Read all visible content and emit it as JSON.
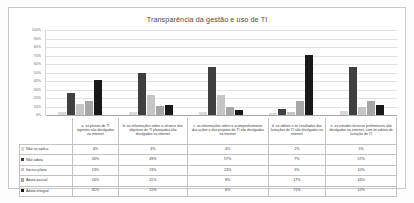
{
  "chart_data": {
    "type": "bar",
    "title": "Transparência da gestão e uso de TI",
    "xlabel": "",
    "ylabel": "",
    "ylim": [
      0,
      100
    ],
    "grid": true,
    "legend_position": "data-table-left",
    "ytick_labels": [
      "100%",
      "90%",
      "80%",
      "70%",
      "60%",
      "50%",
      "40%",
      "30%",
      "20%",
      "10%",
      "0%"
    ],
    "ytick_values": [
      100,
      90,
      80,
      70,
      60,
      50,
      40,
      30,
      20,
      10,
      0
    ],
    "categories": [
      "a. os planos de TI vigentes são divulgados na internet",
      "b. as informações sobre o alcance dos objetivos de TI planejados são divulgados na internet",
      "c. as informações sobre o acompanhamento das ações e dos projetos de TI são divulgadas na internet",
      "d. os editais e os resultados das licitações de TI são divulgados na internet",
      "e. os estudos técnicos preliminares são divulgados na internet, com os editais de licitação de TI"
    ],
    "series": [
      {
        "name": "Não se aplica",
        "color": "#d9d9d9",
        "values": [
          4,
          4,
          4,
          2,
          5
        ],
        "labels": [
          "4%",
          "4%",
          "4%",
          "2%",
          "5%"
        ]
      },
      {
        "name": "Não adota",
        "color": "#3f3f3f",
        "values": [
          26,
          49,
          57,
          7,
          57
        ],
        "labels": [
          "26%",
          "49%",
          "57%",
          "7%",
          "57%"
        ]
      },
      {
        "name": "Iniciou plano",
        "color": "#c6c6c6",
        "values": [
          13,
          23,
          23,
          3,
          10
        ],
        "labels": [
          "13%",
          "23%",
          "23%",
          "3%",
          "10%"
        ]
      },
      {
        "name": "Adota parcial",
        "color": "#a6a6a6",
        "values": [
          16,
          11,
          9,
          17,
          16
        ],
        "labels": [
          "16%",
          "11%",
          "9%",
          "17%",
          "16%"
        ]
      },
      {
        "name": "Adota integral",
        "color": "#1a1a1a",
        "values": [
          41,
          12,
          6,
          71,
          12
        ],
        "labels": [
          "41%",
          "12%",
          "6%",
          "71%",
          "12%"
        ]
      }
    ]
  }
}
